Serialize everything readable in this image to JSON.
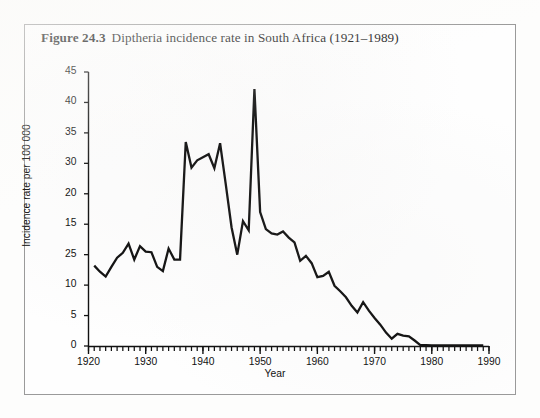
{
  "figure": {
    "number": "Figure 24.3",
    "caption": "Diptheria incidence rate in South Africa (1921–1989)"
  },
  "chart_data": {
    "type": "line",
    "title": "Diptheria incidence rate in South Africa (1921–1989)",
    "xlabel": "Year",
    "ylabel": "Incidence rate per 100 000",
    "xlim": [
      1920,
      1990
    ],
    "ylim": [
      0,
      45
    ],
    "grid": false,
    "legend": null,
    "line_color": "#111111",
    "xticks": [
      "1920",
      "1930",
      "1940",
      "1950",
      "1960",
      "1970",
      "1980",
      "1990"
    ],
    "xtick_values": [
      1920,
      1930,
      1940,
      1950,
      1960,
      1970,
      1980,
      1990
    ],
    "xtick_minor_step": 1,
    "yticks": [
      "45",
      "40",
      "35",
      "30",
      "20",
      "15",
      "25",
      "10",
      "5",
      "0"
    ],
    "ytick_positions": [
      45,
      40,
      35,
      30,
      25,
      20,
      15,
      10,
      5,
      0
    ],
    "ytick_note": "Printed labels at the 25 and 20 gridline positions are transposed in the original scan",
    "x": [
      1921,
      1922,
      1923,
      1924,
      1925,
      1926,
      1927,
      1928,
      1929,
      1930,
      1931,
      1932,
      1933,
      1934,
      1935,
      1936,
      1937,
      1938,
      1939,
      1940,
      1941,
      1942,
      1943,
      1944,
      1945,
      1946,
      1947,
      1948,
      1949,
      1950,
      1951,
      1952,
      1953,
      1954,
      1955,
      1956,
      1957,
      1958,
      1959,
      1960,
      1961,
      1962,
      1963,
      1964,
      1965,
      1966,
      1967,
      1968,
      1969,
      1970,
      1971,
      1972,
      1973,
      1974,
      1975,
      1976,
      1977,
      1978,
      1979,
      1980,
      1981,
      1982,
      1983,
      1984,
      1985,
      1986,
      1987,
      1988,
      1989
    ],
    "values": [
      13.2,
      12.2,
      11.4,
      13.0,
      14.5,
      15.3,
      16.8,
      14.2,
      16.4,
      15.5,
      15.4,
      13.0,
      12.3,
      16.0,
      14.2,
      14.2,
      33.5,
      29.3,
      30.5,
      31.0,
      31.5,
      29.2,
      33.3,
      26.5,
      19.5,
      15.0,
      20.5,
      19.0,
      42.2,
      22.0,
      19.2,
      18.5,
      18.3,
      18.8,
      17.8,
      17.0,
      14.0,
      14.8,
      13.6,
      11.3,
      11.5,
      12.2,
      9.9,
      9.0,
      8.0,
      6.6,
      5.5,
      7.2,
      5.8,
      4.6,
      3.5,
      2.2,
      1.2,
      2.0,
      1.7,
      1.6,
      0.9,
      0.15,
      0.12,
      0.1,
      0.1,
      0.1,
      0.1,
      0.1,
      0.1,
      0.1,
      0.1,
      0.1,
      0.1
    ]
  }
}
